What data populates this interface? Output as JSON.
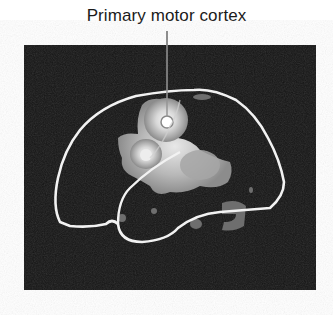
{
  "figure": {
    "label": "Primary motor cortex",
    "colors": {
      "background": "#ffffff",
      "panel": "#141414",
      "outline": "#f2f2f2",
      "activation_peak": "#f5f5f5",
      "activation_low": "#7a7a7a",
      "leader_line": "#222222"
    }
  }
}
